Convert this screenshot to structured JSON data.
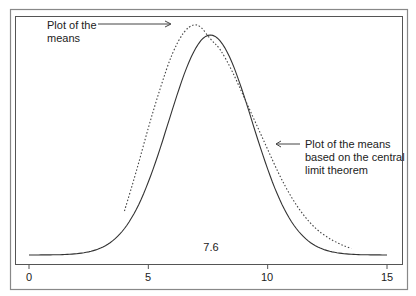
{
  "chart_data": {
    "type": "line",
    "title": "",
    "xlabel": "",
    "ylabel": "",
    "xlim": [
      0,
      15
    ],
    "x_ticks": [
      "0",
      "5",
      "10",
      "15"
    ],
    "grid": false,
    "legend": null,
    "center_label": "7.6",
    "series": [
      {
        "name": "Plot of the means based on the central limit theorem",
        "style": "solid",
        "mean": 7.6,
        "sd": 1.75,
        "x": [
          0,
          1,
          2,
          3,
          4,
          5,
          6,
          7,
          7.6,
          8,
          9,
          10,
          11,
          12,
          13,
          14,
          15
        ],
        "y_rel": [
          0.0,
          0.01,
          0.04,
          0.14,
          0.35,
          0.64,
          0.89,
          0.99,
          1.0,
          0.99,
          0.88,
          0.65,
          0.39,
          0.18,
          0.06,
          0.02,
          0.0
        ]
      },
      {
        "name": "Plot of the means",
        "style": "dotted",
        "x": [
          4.0,
          4.5,
          5,
          5.5,
          6,
          6.5,
          6.9,
          7.2,
          7.6,
          8,
          8.5,
          9,
          9.5,
          10,
          10.5,
          11,
          11.5,
          12,
          12.5,
          13,
          13.5
        ],
        "y_rel": [
          0.2,
          0.38,
          0.58,
          0.76,
          0.92,
          1.02,
          1.05,
          1.04,
          0.98,
          0.94,
          0.84,
          0.72,
          0.6,
          0.48,
          0.36,
          0.26,
          0.18,
          0.12,
          0.08,
          0.05,
          0.03
        ]
      }
    ],
    "annotations": [
      {
        "text": "Plot of the means",
        "target": "dotted-peak"
      },
      {
        "text": "Plot of the means based on the central limit theorem",
        "target": "solid-right-slope"
      }
    ]
  },
  "labels": {
    "means_line1": "Plot of the",
    "means_line2": "means",
    "clt_line1": "Plot of the means",
    "clt_line2": "based on the central",
    "clt_line3": "limit theorem",
    "center": "7.6",
    "tick0": "0",
    "tick5": "5",
    "tick10": "10",
    "tick15": "15"
  }
}
